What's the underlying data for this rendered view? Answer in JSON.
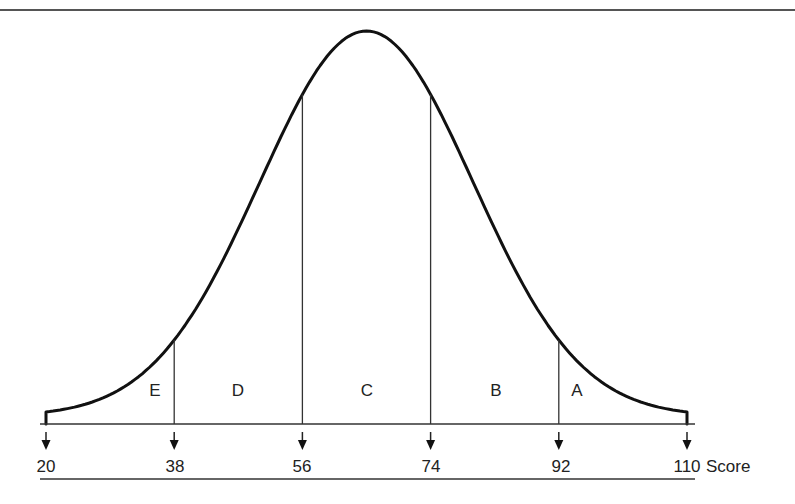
{
  "chart_data": {
    "type": "area",
    "title": "",
    "xlabel": "Score",
    "ylabel": "",
    "x_ticks": [
      20,
      38,
      56,
      74,
      92,
      110
    ],
    "x_tick_labels": [
      "20",
      "38",
      "56",
      "74",
      "92",
      "110"
    ],
    "xlim": [
      20,
      110
    ],
    "distribution": {
      "kind": "normal",
      "mean": 65,
      "sd": 15
    },
    "regions": [
      {
        "label": "E",
        "from": 20,
        "to": 38
      },
      {
        "label": "D",
        "from": 38,
        "to": 56
      },
      {
        "label": "C",
        "from": 56,
        "to": 74
      },
      {
        "label": "B",
        "from": 74,
        "to": 92
      },
      {
        "label": "A",
        "from": 92,
        "to": 110
      }
    ],
    "grid": false,
    "legend": null
  },
  "axis": {
    "unit_label": "Score",
    "labels": [
      "20",
      "38",
      "56",
      "74",
      "92",
      "110"
    ]
  },
  "regions": {
    "e": "E",
    "d": "D",
    "c": "C",
    "b": "B",
    "a": "A"
  },
  "colors": {
    "line": "#111111",
    "background": "#ffffff"
  }
}
